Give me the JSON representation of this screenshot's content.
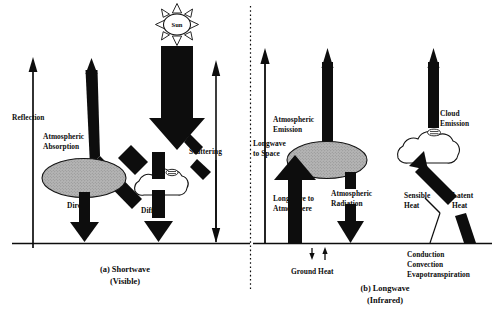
{
  "figure": {
    "panels": [
      {
        "id": "shortwave",
        "caption_line1": "(a) Shortwave",
        "caption_line2": "(Visible)",
        "labels": {
          "sun": "Sun",
          "reflection": "Reflection",
          "atmospheric_absorption_line1": "Atmospheric",
          "atmospheric_absorption_line2": "Absorption",
          "direct": "Direct",
          "diffuse": "Diffuse",
          "scattering": "Scattering"
        }
      },
      {
        "id": "longwave",
        "caption_line1": "(b) Longwave",
        "caption_line2": "(Infrared)",
        "labels": {
          "atmospheric_emission_line1": "Atmospheric",
          "atmospheric_emission_line2": "Emission",
          "cloud_emission_line1": "Cloud",
          "cloud_emission_line2": "Emission",
          "longwave_to_space_line1": "Longwave",
          "longwave_to_space_line2": "to Space",
          "longwave_to_atmosphere_line1": "Longwave to",
          "longwave_to_atmosphere_line2": "Atmosphere",
          "atmospheric_radiation_line1": "Atmospheric",
          "atmospheric_radiation_line2": "Radiation",
          "sensible_heat_line1": "Sensible",
          "sensible_heat_line2": "Heat",
          "latent_heat_line1": "Latent",
          "latent_heat_line2": "Heat",
          "ground_heat": "Ground Heat",
          "transfer_line1": "Conduction",
          "transfer_line2": "Convection",
          "transfer_line3": "Evapotranspiration"
        }
      }
    ],
    "colors": {
      "ink": "#0d0d0d",
      "ellipse_fill": "#b0b0b0",
      "cloud_fill": "#ffffff",
      "background": "#ffffff"
    }
  }
}
